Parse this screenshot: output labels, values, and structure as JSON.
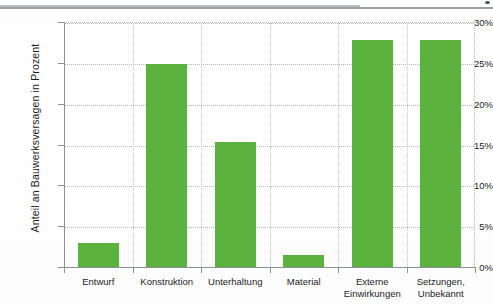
{
  "page": {
    "top_rule": "horizontal-rule",
    "corner_mark": "scan-speck"
  },
  "chart_data": {
    "type": "bar",
    "title": "",
    "subtitle": "",
    "xlabel": "",
    "ylabel": "Anteil an Bauwerksversagen in Prozent",
    "categories": [
      "Entwurf",
      "Konstruktion",
      "Unterhaltung",
      "Material",
      "Externe Einwirkungen",
      "Setzungen, Unbekannt"
    ],
    "category_lines": [
      [
        "Entwurf"
      ],
      [
        "Konstruktion"
      ],
      [
        "Unterhaltung"
      ],
      [
        "Material"
      ],
      [
        "Externe",
        "Einwirkungen"
      ],
      [
        "Setzungen,",
        "Unbekannt"
      ]
    ],
    "values": [
      3.0,
      24.9,
      15.3,
      1.5,
      27.8,
      27.8
    ],
    "ylim": [
      0,
      30
    ],
    "yticks": [
      0,
      5,
      10,
      15,
      20,
      25,
      30
    ],
    "ytick_labels": [
      "0%",
      "5%",
      "10%",
      "15%",
      "20%",
      "25%",
      "30%"
    ],
    "grid": true,
    "grid_style": "dotted",
    "legend": false,
    "bar_color": "#5cb23e",
    "grid_color": "#b6b9bd",
    "axis_color": "#8e9296",
    "text_color": "#1c1c1c"
  }
}
